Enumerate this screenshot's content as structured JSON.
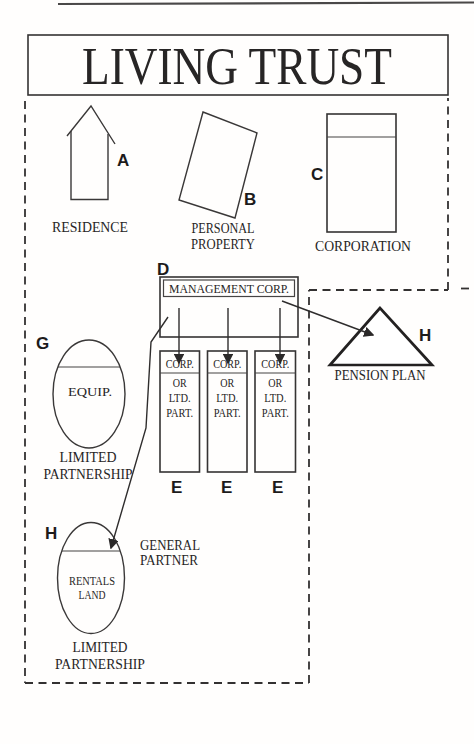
{
  "title": "LIVING TRUST",
  "colors": {
    "ink": "#272525",
    "line": "#3a3838",
    "paper": "#ffffff"
  },
  "nodes": {
    "residence": {
      "tag": "A",
      "label": "RESIDENCE"
    },
    "personal_property": {
      "tag": "B",
      "label_1": "PERSONAL",
      "label_2": "PROPERTY"
    },
    "corporation": {
      "tag": "C",
      "label": "CORPORATION"
    },
    "management_corp": {
      "tag": "D",
      "label": "MANAGEMENT CORP."
    },
    "operating_entity": {
      "tag": "E",
      "line_1": "CORP.",
      "line_2": "OR",
      "line_3": "LTD.",
      "line_4": "PART."
    },
    "equipment_partnership": {
      "tag": "G",
      "asset": "EQUIP.",
      "label_1": "LIMITED",
      "label_2": "PARTNERSHIP"
    },
    "pension_plan": {
      "tag": "H",
      "label": "PENSION PLAN"
    },
    "rentals_partnership": {
      "tag": "H",
      "asset_1": "RENTALS",
      "asset_2": "LAND",
      "role_1": "GENERAL",
      "role_2": "PARTNER",
      "label_1": "LIMITED",
      "label_2": "PARTNERSHIP"
    }
  }
}
